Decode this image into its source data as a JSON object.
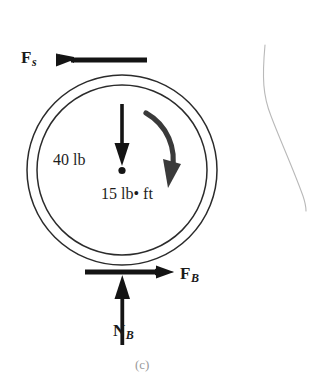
{
  "figure": {
    "caption": "(c)",
    "kind": "free-body-diagram"
  },
  "labels": {
    "friction_spool": {
      "symbol": "F",
      "subscript": "s"
    },
    "friction_board": {
      "symbol": "F",
      "subscript": "B"
    },
    "normal_board": {
      "symbol": "N",
      "subscript": "B"
    },
    "weight": "40 lb",
    "moment": "15 lb• ft"
  },
  "colors": {
    "ink": "#1a1a1a",
    "arrow": "#141414",
    "circle_stroke": "#2b2b2b",
    "page_edge": "#b8b8b8",
    "caption": "#9a9a9a",
    "background": "#ffffff"
  },
  "geometry": {
    "wheel_center": {
      "x": 122,
      "y": 170
    },
    "outer_radius": 95,
    "inner_radius": 85
  }
}
